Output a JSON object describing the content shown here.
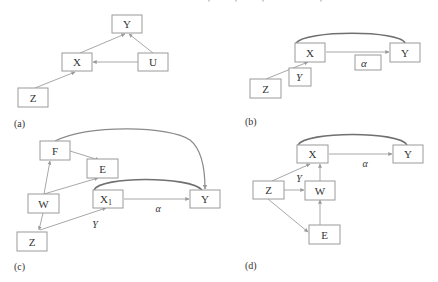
{
  "figure": {
    "panels": [
      {
        "id": "a",
        "label": "(a)",
        "nodes": [
          {
            "id": "Y",
            "text": "Y"
          },
          {
            "id": "X",
            "text": "X"
          },
          {
            "id": "U",
            "text": "U"
          },
          {
            "id": "Z",
            "text": "Z"
          }
        ],
        "edges": [
          {
            "from": "X",
            "to": "Y"
          },
          {
            "from": "U",
            "to": "Y"
          },
          {
            "from": "U",
            "to": "X"
          },
          {
            "from": "Z",
            "to": "X"
          }
        ]
      },
      {
        "id": "b",
        "label": "(b)",
        "nodes": [
          {
            "id": "X",
            "text": "X"
          },
          {
            "id": "Y",
            "text": "Y"
          },
          {
            "id": "alpha",
            "text": "α"
          },
          {
            "id": "upsilon",
            "text": "Υ"
          },
          {
            "id": "Z",
            "text": "Z"
          }
        ],
        "edges": [
          {
            "from": "X",
            "to": "Y",
            "label": "α"
          },
          {
            "from": "Z",
            "to": "X",
            "label": "Υ"
          },
          {
            "from": "X",
            "to": "Y",
            "type": "bidirected-curve"
          }
        ]
      },
      {
        "id": "c",
        "label": "(c)",
        "nodes": [
          {
            "id": "F",
            "text": "F"
          },
          {
            "id": "E",
            "text": "E"
          },
          {
            "id": "W",
            "text": "W"
          },
          {
            "id": "X1",
            "text": "X",
            "subscript": "1"
          },
          {
            "id": "Y",
            "text": "Y"
          },
          {
            "id": "Z",
            "text": "Z"
          }
        ],
        "edge_labels": {
          "alpha": "α",
          "upsilon": "Υ"
        },
        "edges": [
          {
            "from": "F",
            "to": "E"
          },
          {
            "from": "W",
            "to": "F"
          },
          {
            "from": "W",
            "to": "E"
          },
          {
            "from": "W",
            "to": "Z"
          },
          {
            "from": "Z",
            "to": "X1",
            "label": "Υ"
          },
          {
            "from": "X1",
            "to": "Y",
            "label": "α"
          },
          {
            "from": "X1",
            "to": "Y",
            "type": "bidirected-curve"
          },
          {
            "from": "Y",
            "to": "F",
            "type": "bidirected-curve"
          }
        ]
      },
      {
        "id": "d",
        "label": "(d)",
        "nodes": [
          {
            "id": "X",
            "text": "X"
          },
          {
            "id": "Y",
            "text": "Y"
          },
          {
            "id": "Z",
            "text": "Z"
          },
          {
            "id": "W",
            "text": "W"
          },
          {
            "id": "E",
            "text": "E"
          }
        ],
        "edge_labels": {
          "alpha": "α",
          "upsilon": "Υ"
        },
        "edges": [
          {
            "from": "X",
            "to": "Y",
            "label": "α"
          },
          {
            "from": "Z",
            "to": "X",
            "label": "Υ"
          },
          {
            "from": "Z",
            "to": "W"
          },
          {
            "from": "Z",
            "to": "E"
          },
          {
            "from": "W",
            "to": "X"
          },
          {
            "from": "E",
            "to": "W"
          },
          {
            "from": "X",
            "to": "Y",
            "type": "bidirected-curve"
          }
        ]
      }
    ]
  }
}
